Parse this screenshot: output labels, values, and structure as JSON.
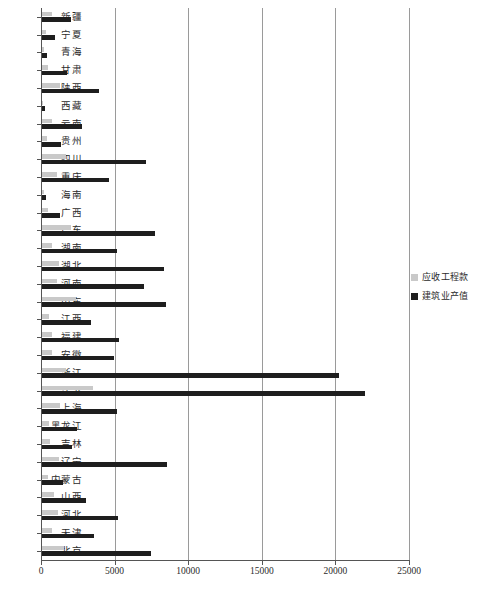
{
  "chart_data": {
    "type": "bar",
    "orientation": "horizontal",
    "title": "",
    "xlabel": "",
    "ylabel": "",
    "xlim": [
      0,
      25000
    ],
    "xticks": [
      "0",
      "5000",
      "10000",
      "15000",
      "20000",
      "25000"
    ],
    "xtick_values": [
      0,
      5000,
      10000,
      15000,
      20000,
      25000
    ],
    "grid": true,
    "grid_axis": "x",
    "legend_position": "right",
    "categories": [
      "新疆",
      "宁夏",
      "青海",
      "甘肃",
      "陕西",
      "西藏",
      "云南",
      "贵州",
      "四川",
      "重庆",
      "海南",
      "广西",
      "广东",
      "湖南",
      "湖北",
      "河南",
      "山东",
      "江西",
      "福建",
      "安徽",
      "浙江",
      "江苏",
      "上海",
      "黑龙江",
      "吉林",
      "辽宁",
      "内蒙古",
      "山西",
      "河北",
      "天津",
      "北京"
    ],
    "series": [
      {
        "name": "应收工程款",
        "color": "#c9c9c9",
        "values": [
          700,
          250,
          150,
          420,
          1250,
          90,
          700,
          350,
          1600,
          1050,
          120,
          400,
          1950,
          700,
          1150,
          1050,
          2300,
          500,
          700,
          700,
          1650,
          3450,
          1200,
          450,
          550,
          1150,
          400,
          800,
          1100,
          700,
          1500
        ]
      },
      {
        "name": "建筑业产值",
        "color": "#1e1e1e",
        "values": [
          1950,
          900,
          320,
          1700,
          3900,
          180,
          2700,
          1300,
          7050,
          4550,
          260,
          1200,
          7700,
          5100,
          8300,
          6900,
          8400,
          3350,
          5250,
          4900,
          20200,
          21950,
          5100,
          2400,
          2050,
          8500,
          1400,
          3000,
          5150,
          3550,
          7400
        ]
      }
    ]
  },
  "legend": {
    "items": [
      {
        "label": "应收工程款",
        "swatch": "light-gray-swatch"
      },
      {
        "label": "建筑业产值",
        "swatch": "dark-swatch"
      }
    ]
  }
}
